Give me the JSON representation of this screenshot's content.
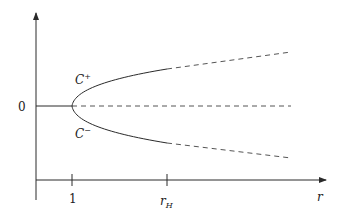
{
  "diagram": {
    "type": "bifurcation-diagram",
    "colors": {
      "line": "#2a2a2a",
      "dashed": "#555555",
      "text": "#222222"
    },
    "y_axis": {
      "zero_label": "0"
    },
    "x_axis": {
      "label": "r",
      "ticks": [
        {
          "label": "1",
          "x": 72
        },
        {
          "label_main": "r",
          "label_sub": "H",
          "x": 167
        }
      ]
    },
    "branches": {
      "upper_label_main": "C",
      "upper_label_sup": "+",
      "lower_label_main": "C",
      "lower_label_sup": "−"
    },
    "legend_notes": {
      "solid": "stable",
      "dashed": "unstable"
    }
  }
}
